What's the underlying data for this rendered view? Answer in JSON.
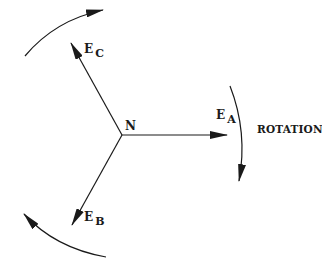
{
  "diagram": {
    "type": "three-phase phasor diagram",
    "neutral_label": "N",
    "phasors": [
      {
        "name": "E",
        "subscript": "A",
        "angle_deg": 0
      },
      {
        "name": "E",
        "subscript": "B",
        "angle_deg": -120
      },
      {
        "name": "E",
        "subscript": "C",
        "angle_deg": 120
      }
    ],
    "rotation_label": "ROTATION",
    "colors": {
      "stroke": "#1a1a1a",
      "background": "#ffffff"
    }
  }
}
